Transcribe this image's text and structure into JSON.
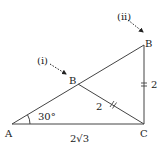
{
  "diagram": {
    "type": "geometry-triangle",
    "points": {
      "A": {
        "label": "A"
      },
      "C": {
        "label": "C"
      },
      "B_i": {
        "label": "B"
      },
      "B_ii": {
        "label": "B"
      }
    },
    "annotations": {
      "case_i": "(i)",
      "case_ii": "(ii)",
      "angle_A": "30°",
      "side_AC": "2√3",
      "side_BC_ii": "2",
      "side_BC_i": "2"
    },
    "colors": {
      "stroke": "#444444",
      "text": "#222222"
    }
  }
}
